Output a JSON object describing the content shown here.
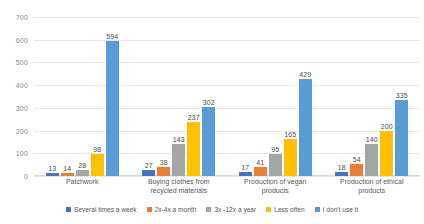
{
  "chart_data": {
    "type": "bar",
    "title": "",
    "xlabel": "",
    "ylabel": "",
    "ylim": [
      0,
      700
    ],
    "ytick_values": [
      0,
      100,
      200,
      300,
      400,
      500,
      600,
      700
    ],
    "ytick_labels": [
      "0",
      "100",
      "200",
      "300",
      "400",
      "500",
      "600",
      "700"
    ],
    "grid": true,
    "legend_position": "bottom",
    "categories": [
      "Patchwork",
      "Buying clothes from recycled materials",
      "Production of vegan products",
      "Production of ethical products"
    ],
    "category_lines": [
      [
        "Patchwork"
      ],
      [
        "Buying clothes from",
        "recycled materials"
      ],
      [
        "Production of vegan",
        "products"
      ],
      [
        "Production of ethical",
        "products"
      ]
    ],
    "series": [
      {
        "name": "Several times a week",
        "color": "#4472C4",
        "values": [
          13,
          27,
          17,
          18
        ]
      },
      {
        "name": "2x-4x a month",
        "color": "#ED7D31",
        "values": [
          14,
          38,
          41,
          54
        ]
      },
      {
        "name": "3x -12x a year",
        "color": "#A5A5A5",
        "values": [
          28,
          143,
          95,
          140
        ]
      },
      {
        "name": "Less often",
        "color": "#FFC000",
        "values": [
          98,
          237,
          165,
          200
        ]
      },
      {
        "name": "I don't use it",
        "color": "#5B9BD5",
        "values": [
          594,
          302,
          429,
          335
        ]
      }
    ]
  },
  "colors": {
    "grid": "#e8e8e8",
    "axis_text": "#8a8a8a",
    "label_text": "#595959",
    "value_text": "#4d4d4d",
    "background": "#ffffff"
  }
}
